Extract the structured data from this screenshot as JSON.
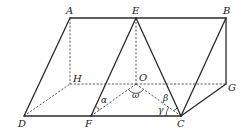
{
  "diagram": {
    "type": "geometry-3d-figure",
    "points": {
      "A": {
        "label": "A",
        "x": 70,
        "y": 18
      },
      "E": {
        "label": "E",
        "x": 136,
        "y": 18
      },
      "B": {
        "label": "B",
        "x": 226,
        "y": 18
      },
      "H": {
        "label": "H",
        "x": 70,
        "y": 84
      },
      "O": {
        "label": "O",
        "x": 136,
        "y": 84
      },
      "G": {
        "label": "G",
        "x": 226,
        "y": 84
      },
      "D": {
        "label": "D",
        "x": 24,
        "y": 116
      },
      "F": {
        "label": "F",
        "x": 91,
        "y": 116
      },
      "C": {
        "label": "C",
        "x": 181,
        "y": 116
      }
    },
    "solid_edges": [
      [
        "A",
        "E"
      ],
      [
        "E",
        "B"
      ],
      [
        "D",
        "A"
      ],
      [
        "D",
        "F"
      ],
      [
        "F",
        "C"
      ],
      [
        "F",
        "E"
      ],
      [
        "E",
        "C"
      ],
      [
        "C",
        "B"
      ],
      [
        "B",
        "G"
      ],
      [
        "G",
        "C"
      ]
    ],
    "dashed_edges": [
      [
        "A",
        "H"
      ],
      [
        "E",
        "O"
      ],
      [
        "H",
        "O"
      ],
      [
        "O",
        "G"
      ],
      [
        "D",
        "H"
      ],
      [
        "O",
        "C"
      ],
      [
        "F",
        "O"
      ]
    ],
    "angles": {
      "alpha": {
        "label": "α",
        "vertex": "F"
      },
      "omega": {
        "label": "ω",
        "vertex": "O"
      },
      "beta": {
        "label": "β",
        "vertex": "C"
      },
      "gamma": {
        "label": "γ",
        "vertex": "C"
      }
    }
  }
}
